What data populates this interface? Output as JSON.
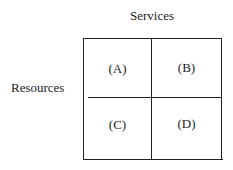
{
  "diagram": {
    "column_axis_label": "Services",
    "row_axis_label": "Resources",
    "cells": [
      {
        "label": "(A)"
      },
      {
        "label": "(B)"
      },
      {
        "label": "(C)"
      },
      {
        "label": "(D)"
      }
    ]
  }
}
